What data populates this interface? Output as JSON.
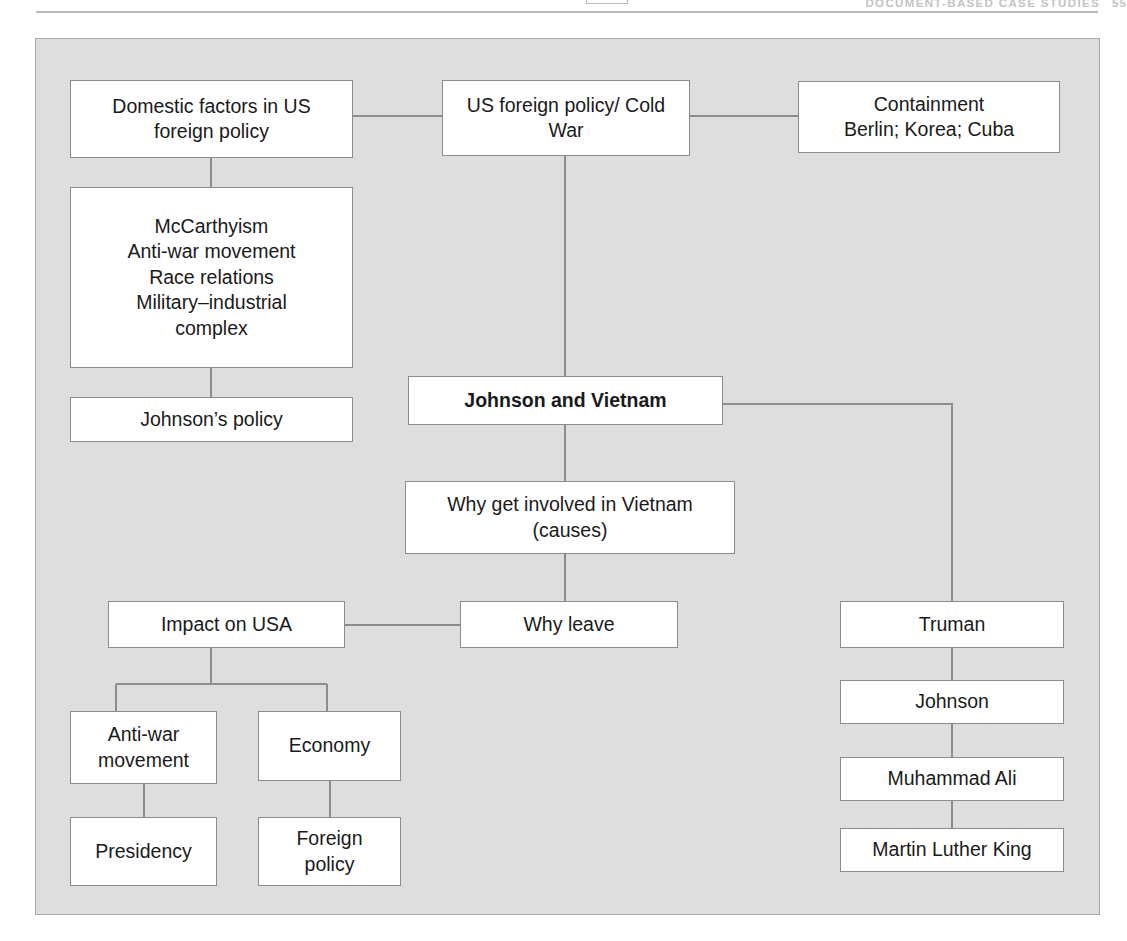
{
  "page": {
    "header_text": "DOCUMENT-BASED CASE STUDIES",
    "page_number": "55"
  },
  "diagram": {
    "title": "Johnson and Vietnam",
    "panel_color": "#dedede",
    "box_fill": "#ffffff",
    "box_border": "#8c8c8c",
    "nodes": [
      {
        "id": "domestic-factors",
        "label": "Domestic factors in US\nforeign policy"
      },
      {
        "id": "us-foreign-policy",
        "label": "US foreign policy/ Cold\nWar"
      },
      {
        "id": "containment",
        "label": "Containment\nBerlin; Korea; Cuba"
      },
      {
        "id": "domestic-issues",
        "label": "McCarthyism\nAnti-war movement\nRace relations\nMilitary–industrial\ncomplex"
      },
      {
        "id": "johnsons-policy",
        "label": "Johnson’s policy"
      },
      {
        "id": "johnson-and-vietnam",
        "label": "Johnson and Vietnam"
      },
      {
        "id": "why-get-involved",
        "label": "Why get involved in Vietnam\n(causes)"
      },
      {
        "id": "impact-on-usa",
        "label": "Impact on USA"
      },
      {
        "id": "why-leave",
        "label": "Why leave"
      },
      {
        "id": "anti-war-movement",
        "label": "Anti-war\nmovement"
      },
      {
        "id": "economy",
        "label": "Economy"
      },
      {
        "id": "presidency",
        "label": "Presidency"
      },
      {
        "id": "foreign-policy",
        "label": "Foreign\npolicy"
      },
      {
        "id": "truman",
        "label": "Truman"
      },
      {
        "id": "johnson",
        "label": "Johnson"
      },
      {
        "id": "muhammad-ali",
        "label": "Muhammad Ali"
      },
      {
        "id": "martin-luther-king",
        "label": "Martin Luther King"
      }
    ],
    "edges": [
      {
        "from": "domestic-factors",
        "to": "us-foreign-policy"
      },
      {
        "from": "us-foreign-policy",
        "to": "containment"
      },
      {
        "from": "domestic-factors",
        "to": "domestic-issues"
      },
      {
        "from": "domestic-issues",
        "to": "johnsons-policy"
      },
      {
        "from": "us-foreign-policy",
        "to": "johnson-and-vietnam"
      },
      {
        "from": "johnson-and-vietnam",
        "to": "why-get-involved"
      },
      {
        "from": "why-get-involved",
        "to": "why-leave"
      },
      {
        "from": "why-leave",
        "to": "impact-on-usa"
      },
      {
        "from": "impact-on-usa",
        "to": "anti-war-movement"
      },
      {
        "from": "impact-on-usa",
        "to": "economy"
      },
      {
        "from": "anti-war-movement",
        "to": "presidency"
      },
      {
        "from": "economy",
        "to": "foreign-policy"
      },
      {
        "from": "johnson-and-vietnam",
        "to": "truman"
      },
      {
        "from": "truman",
        "to": "johnson"
      },
      {
        "from": "johnson",
        "to": "muhammad-ali"
      },
      {
        "from": "muhammad-ali",
        "to": "martin-luther-king"
      }
    ]
  }
}
